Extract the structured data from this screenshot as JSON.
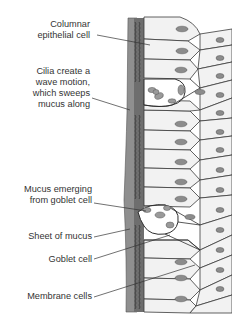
{
  "diagram": {
    "labels": [
      {
        "id": "columnar",
        "lines": [
          "Columnar",
          "epithelial cell"
        ]
      },
      {
        "id": "cilia",
        "lines": [
          "Cilia create a",
          "wave motion,",
          "which sweeps",
          "mucus along"
        ]
      },
      {
        "id": "mucus-emerging",
        "lines": [
          "Mucus emerging",
          "from goblet cell"
        ]
      },
      {
        "id": "sheet",
        "lines": [
          "Sheet of mucus"
        ]
      },
      {
        "id": "goblet",
        "lines": [
          "Goblet cell"
        ]
      },
      {
        "id": "membrane",
        "lines": [
          "Membrane cells"
        ]
      }
    ],
    "colors": {
      "mucus_sheet": "#8f8f8f",
      "cilia_band": "#6e6e6e",
      "cell_fill": "#f2f2f2",
      "cell_outline": "#3a3a3a",
      "nucleus": "#8c8c8c",
      "goblet_fill": "#ffffff",
      "text": "#333333"
    }
  }
}
